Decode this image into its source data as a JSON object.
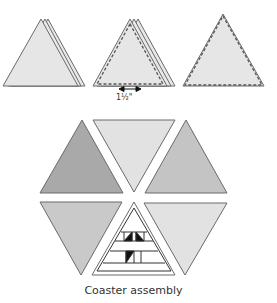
{
  "diagram": {
    "step_labels": {
      "measurement": "1½\""
    },
    "caption": "Coaster assembly",
    "colors": {
      "light_fill": "#e6e6e6",
      "medium_fill": "#c9c9c9",
      "dark_fill": "#a9a9a9",
      "lighter_fill": "#dedede",
      "outline": "#6a6a6a",
      "black": "#111111"
    },
    "steps": [
      {
        "name": "stacked-triangles"
      },
      {
        "name": "stitched-stacked-triangles"
      },
      {
        "name": "stitched-triangle"
      }
    ],
    "hexagon_pieces": [
      {
        "position": "top-left",
        "orientation": "up",
        "shade": "dark"
      },
      {
        "position": "top-center",
        "orientation": "down",
        "shade": "light"
      },
      {
        "position": "top-right",
        "orientation": "up",
        "shade": "medium"
      },
      {
        "position": "bottom-left",
        "orientation": "down",
        "shade": "medium"
      },
      {
        "position": "bottom-center",
        "orientation": "up",
        "shade": "patchwork"
      },
      {
        "position": "bottom-right",
        "orientation": "down",
        "shade": "light"
      }
    ]
  }
}
